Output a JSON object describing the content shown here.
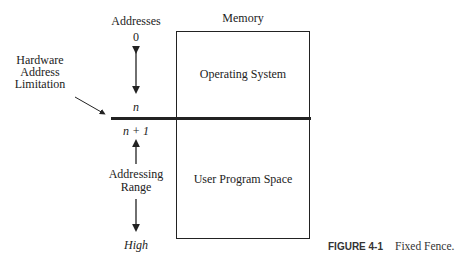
{
  "diagram": {
    "addresses_label": "Addresses",
    "memory_label": "Memory",
    "address_zero": "0",
    "address_n": "n",
    "address_n_plus_1": "n + 1",
    "address_high": "High",
    "hardware_label": [
      "Hardware",
      "Address",
      "Limitation"
    ],
    "addressing_range_label": [
      "Addressing",
      "Range"
    ],
    "os_region": "Operating System",
    "user_region": "User Program Space"
  },
  "caption": {
    "label": "FIGURE 4-1",
    "text": "Fixed Fence."
  }
}
